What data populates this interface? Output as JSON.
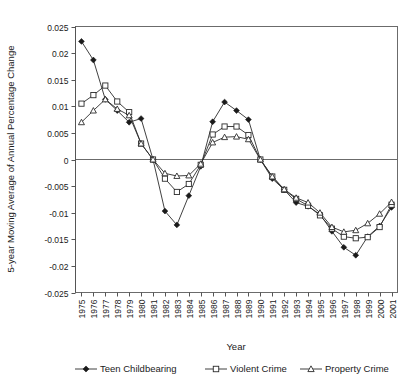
{
  "chart_data": {
    "type": "line",
    "title": "",
    "xlabel": "Year",
    "ylabel": "5-year Moving Average of Annual Percentage Change",
    "ylim": [
      -0.025,
      0.025
    ],
    "ytick_labels": [
      "0.025",
      "0.02",
      "0.015",
      "0.01",
      "0.005",
      "0",
      "-0.005",
      "-0.01",
      "-0.015",
      "-0.02",
      "-0.025"
    ],
    "ytick_values": [
      0.025,
      0.02,
      0.015,
      0.01,
      0.005,
      0,
      -0.005,
      -0.01,
      -0.015,
      -0.02,
      -0.025
    ],
    "grid": false,
    "legend_position": "bottom",
    "categories": [
      "1975",
      "1976",
      "1977",
      "1978",
      "1979",
      "1980",
      "1981",
      "1982",
      "1983",
      "1984",
      "1985",
      "1986",
      "1987",
      "1988",
      "1989",
      "1990",
      "1991",
      "1992",
      "1993",
      "1994",
      "1995",
      "1996",
      "1997",
      "1998",
      "1999",
      "2000",
      "2001"
    ],
    "series": [
      {
        "name": "Teen Childbearing",
        "marker": "filled-diamond",
        "values": [
          0.0222,
          0.0187,
          0.0113,
          0.0092,
          0.007,
          0.0077,
          0.0,
          -0.0097,
          -0.0123,
          -0.0068,
          -0.0013,
          0.0071,
          0.0108,
          0.0092,
          0.0075,
          0.0,
          -0.0036,
          -0.0057,
          -0.0081,
          -0.0088,
          -0.0103,
          -0.0135,
          -0.0165,
          -0.018,
          -0.0145,
          -0.0125,
          -0.009
        ]
      },
      {
        "name": "Violent Crime",
        "marker": "open-square",
        "values": [
          0.0105,
          0.0121,
          0.0139,
          0.0109,
          0.0089,
          0.003,
          0.0,
          -0.0036,
          -0.0061,
          -0.0046,
          -0.001,
          0.0047,
          0.0062,
          0.0062,
          0.0046,
          0.0,
          -0.0032,
          -0.0057,
          -0.0074,
          -0.0087,
          -0.0105,
          -0.013,
          -0.0145,
          -0.0148,
          -0.0146,
          -0.0127,
          -0.0085
        ]
      },
      {
        "name": "Property Crime",
        "marker": "open-triangle",
        "values": [
          0.007,
          0.0092,
          0.0113,
          0.0095,
          0.0083,
          0.003,
          0.0,
          -0.0026,
          -0.0031,
          -0.003,
          -0.0008,
          0.0032,
          0.0042,
          0.0043,
          0.0038,
          0.0,
          -0.0032,
          -0.0056,
          -0.0072,
          -0.0081,
          -0.01,
          -0.0127,
          -0.0136,
          -0.0133,
          -0.012,
          -0.0102,
          -0.008
        ]
      }
    ]
  },
  "legend": {
    "items": [
      {
        "label": "Teen Childbearing",
        "marker": "filled-diamond"
      },
      {
        "label": "Violent Crime",
        "marker": "open-square"
      },
      {
        "label": "Property Crime",
        "marker": "open-triangle"
      }
    ]
  },
  "colors": {
    "line": "#2b2b2b",
    "frame": "#6b6b6b",
    "text": "#1a1a1a",
    "background": "#ffffff"
  }
}
